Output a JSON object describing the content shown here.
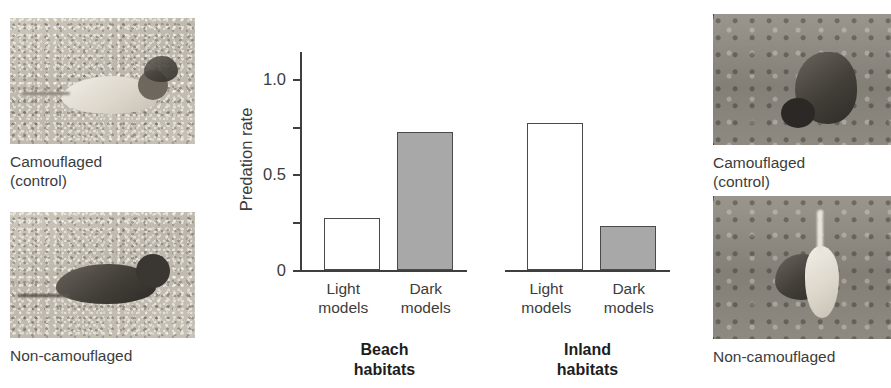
{
  "figure": {
    "left_photos": [
      {
        "id": "beach-camouflaged",
        "caption": "Camouflaged\n(control)",
        "habitat": "beach",
        "model_color": "light",
        "substrate": "sand"
      },
      {
        "id": "beach-non-camouflaged",
        "caption": "Non-camouflaged",
        "habitat": "beach",
        "model_color": "dark",
        "substrate": "sand"
      }
    ],
    "right_photos": [
      {
        "id": "inland-camouflaged",
        "caption": "Camouflaged\n(control)",
        "habitat": "inland",
        "model_color": "dark",
        "substrate": "vegetation"
      },
      {
        "id": "inland-non-camouflaged",
        "caption": "Non-camouflaged",
        "habitat": "inland",
        "model_color": "light",
        "substrate": "vegetation"
      }
    ]
  },
  "chart_data": {
    "type": "bar",
    "title": "",
    "xlabel": "",
    "ylabel": "Predation rate",
    "ylim": [
      0,
      1.15
    ],
    "grid": false,
    "legend": "none",
    "y_ticks": [
      0,
      0.25,
      0.5,
      0.75,
      1.0
    ],
    "y_tick_labels": [
      "0",
      "",
      "0.5",
      "",
      "1.0"
    ],
    "panels": [
      {
        "name": "Beach\nhabitats",
        "categories": [
          "Light\nmodels",
          "Dark\nmodels"
        ],
        "values": [
          0.27,
          0.72
        ],
        "fills": [
          "white",
          "gray"
        ]
      },
      {
        "name": "Inland\nhabitats",
        "categories": [
          "Light\nmodels",
          "Dark\nmodels"
        ],
        "values": [
          0.77,
          0.23
        ],
        "fills": [
          "white",
          "gray"
        ]
      }
    ],
    "colors": {
      "light_model_fill": "#ffffff",
      "dark_model_fill": "#a8a8a8",
      "axis": "#3f3f3f",
      "text": "#3c3c3c"
    }
  }
}
